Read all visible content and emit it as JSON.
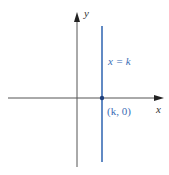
{
  "diagram": {
    "axes": {
      "x_label": "x",
      "y_label": "y",
      "color": "#444444"
    },
    "line": {
      "equation_label": "x = k",
      "color": "#3a6db5"
    },
    "point": {
      "label": "(k, 0)",
      "color": "#1f3f7a"
    },
    "label_color": "#3a6db5"
  }
}
